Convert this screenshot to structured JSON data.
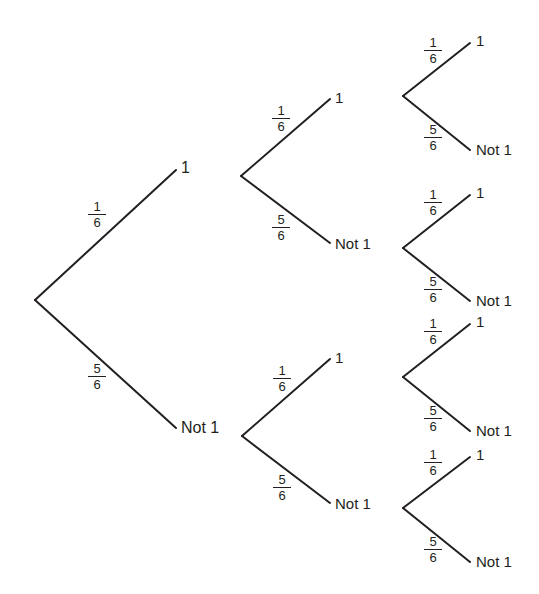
{
  "diagram": {
    "type": "probability-tree",
    "background_color": "#ffffff",
    "line_color": "#231f20",
    "text_color": "#231f20",
    "levels": 3,
    "branching_factor": 2,
    "outcomes": {
      "success": "1",
      "failure": "Not 1"
    },
    "probabilities": {
      "success_num": "1",
      "success_den": "6",
      "failure_num": "5",
      "failure_den": "6"
    }
  },
  "nodes": {
    "root": {
      "x": 35,
      "y": 300
    },
    "level1": [
      {
        "id": "n1",
        "label": "1",
        "x": 178,
        "y": 168,
        "lx": 181,
        "ly": 160
      },
      {
        "id": "n0",
        "label": "Not 1",
        "x": 178,
        "y": 428,
        "lx": 181,
        "ly": 420
      }
    ],
    "level2": [
      {
        "id": "n11",
        "label": "1",
        "x": 332,
        "y": 97,
        "lx": 335,
        "ly": 90
      },
      {
        "id": "n10",
        "label": "Not 1",
        "x": 332,
        "y": 243,
        "lx": 335,
        "ly": 236
      },
      {
        "id": "n01",
        "label": "1",
        "x": 332,
        "y": 357,
        "lx": 335,
        "ly": 350
      },
      {
        "id": "n00",
        "label": "Not 1",
        "x": 332,
        "y": 503,
        "lx": 335,
        "ly": 496
      }
    ],
    "level3": [
      {
        "id": "t111",
        "label": "1",
        "x": 472,
        "y": 41,
        "lx": 476,
        "ly": 33
      },
      {
        "id": "t110",
        "label": "Not 1",
        "x": 472,
        "y": 150,
        "lx": 476,
        "ly": 142
      },
      {
        "id": "t101",
        "label": "1",
        "x": 472,
        "y": 193,
        "lx": 476,
        "ly": 185
      },
      {
        "id": "t100",
        "label": "Not 1",
        "x": 472,
        "y": 301,
        "lx": 476,
        "ly": 293
      },
      {
        "id": "t011",
        "label": "1",
        "x": 472,
        "y": 322,
        "lx": 476,
        "ly": 314
      },
      {
        "id": "t010",
        "label": "Not 1",
        "x": 472,
        "y": 431,
        "lx": 476,
        "ly": 423
      },
      {
        "id": "t001",
        "label": "1",
        "x": 472,
        "y": 455,
        "lx": 476,
        "ly": 447
      },
      {
        "id": "t000",
        "label": "Not 1",
        "x": 472,
        "y": 562,
        "lx": 476,
        "ly": 554
      }
    ]
  },
  "edges": [
    {
      "id": "e-root-1",
      "from": "root",
      "to": "n1",
      "x1": 35,
      "y1": 300,
      "x2": 176,
      "y2": 170
    },
    {
      "id": "e-root-0",
      "from": "root",
      "to": "n0",
      "x1": 35,
      "y1": 300,
      "x2": 176,
      "y2": 428
    },
    {
      "id": "e-n1-1",
      "from": "n1",
      "to": "n11",
      "x1": 241,
      "y1": 176,
      "x2": 330,
      "y2": 99
    },
    {
      "id": "e-n1-0",
      "from": "n1",
      "to": "n10",
      "x1": 241,
      "y1": 176,
      "x2": 330,
      "y2": 243
    },
    {
      "id": "e-n0-1",
      "from": "n0",
      "to": "n01",
      "x1": 242,
      "y1": 436,
      "x2": 330,
      "y2": 359
    },
    {
      "id": "e-n0-0",
      "from": "n0",
      "to": "n00",
      "x1": 242,
      "y1": 436,
      "x2": 330,
      "y2": 503
    },
    {
      "id": "e-n11-1",
      "from": "n11",
      "to": "t111",
      "x1": 403,
      "y1": 96,
      "x2": 470,
      "y2": 43
    },
    {
      "id": "e-n11-0",
      "from": "n11",
      "to": "t110",
      "x1": 403,
      "y1": 96,
      "x2": 470,
      "y2": 150
    },
    {
      "id": "e-n10-1",
      "from": "n10",
      "to": "t101",
      "x1": 403,
      "y1": 248,
      "x2": 470,
      "y2": 195
    },
    {
      "id": "e-n10-0",
      "from": "n10",
      "to": "t100",
      "x1": 403,
      "y1": 248,
      "x2": 470,
      "y2": 301
    },
    {
      "id": "e-n01-1",
      "from": "n01",
      "to": "t011",
      "x1": 403,
      "y1": 377,
      "x2": 470,
      "y2": 324
    },
    {
      "id": "e-n01-0",
      "from": "n01",
      "to": "t010",
      "x1": 403,
      "y1": 377,
      "x2": 470,
      "y2": 431
    },
    {
      "id": "e-n00-1",
      "from": "n00",
      "to": "t001",
      "x1": 403,
      "y1": 508,
      "x2": 470,
      "y2": 457
    },
    {
      "id": "e-n00-0",
      "from": "n00",
      "to": "t000",
      "x1": 403,
      "y1": 508,
      "x2": 470,
      "y2": 562
    }
  ],
  "edge_labels": [
    {
      "id": "p-root-1",
      "num": "1",
      "den": "6",
      "x": 88,
      "y": 200
    },
    {
      "id": "p-root-0",
      "num": "5",
      "den": "6",
      "x": 88,
      "y": 362
    },
    {
      "id": "p-n1-1",
      "num": "1",
      "den": "6",
      "x": 272,
      "y": 104
    },
    {
      "id": "p-n1-0",
      "num": "5",
      "den": "6",
      "x": 272,
      "y": 213
    },
    {
      "id": "p-n0-1",
      "num": "1",
      "den": "6",
      "x": 273,
      "y": 364
    },
    {
      "id": "p-n0-0",
      "num": "5",
      "den": "6",
      "x": 273,
      "y": 473
    },
    {
      "id": "p-n11-1",
      "num": "1",
      "den": "6",
      "x": 424,
      "y": 36
    },
    {
      "id": "p-n11-0",
      "num": "5",
      "den": "6",
      "x": 424,
      "y": 123
    },
    {
      "id": "p-n10-1",
      "num": "1",
      "den": "6",
      "x": 424,
      "y": 188
    },
    {
      "id": "p-n10-0",
      "num": "5",
      "den": "6",
      "x": 424,
      "y": 275
    },
    {
      "id": "p-n01-1",
      "num": "1",
      "den": "6",
      "x": 424,
      "y": 317
    },
    {
      "id": "p-n01-0",
      "num": "5",
      "den": "6",
      "x": 424,
      "y": 404
    },
    {
      "id": "p-n00-1",
      "num": "1",
      "den": "6",
      "x": 424,
      "y": 448
    },
    {
      "id": "p-n00-0",
      "num": "5",
      "den": "6",
      "x": 424,
      "y": 535
    }
  ],
  "chart_data": {
    "type": "diagram",
    "diagram_type": "probability-tree",
    "stages": 3,
    "branch_labels": [
      "1",
      "Not 1"
    ],
    "branch_probabilities": [
      "1/6",
      "5/6"
    ],
    "paths": [
      {
        "sequence": [
          "1",
          "1",
          "1"
        ],
        "probability": "1/6 x 1/6 x 1/6"
      },
      {
        "sequence": [
          "1",
          "1",
          "Not 1"
        ],
        "probability": "1/6 x 1/6 x 5/6"
      },
      {
        "sequence": [
          "1",
          "Not 1",
          "1"
        ],
        "probability": "1/6 x 5/6 x 1/6"
      },
      {
        "sequence": [
          "1",
          "Not 1",
          "Not 1"
        ],
        "probability": "1/6 x 5/6 x 5/6"
      },
      {
        "sequence": [
          "Not 1",
          "1",
          "1"
        ],
        "probability": "5/6 x 1/6 x 1/6"
      },
      {
        "sequence": [
          "Not 1",
          "1",
          "Not 1"
        ],
        "probability": "5/6 x 1/6 x 5/6"
      },
      {
        "sequence": [
          "Not 1",
          "Not 1",
          "1"
        ],
        "probability": "5/6 x 5/6 x 1/6"
      },
      {
        "sequence": [
          "Not 1",
          "Not 1",
          "Not 1"
        ],
        "probability": "5/6 x 5/6 x 5/6"
      }
    ]
  }
}
